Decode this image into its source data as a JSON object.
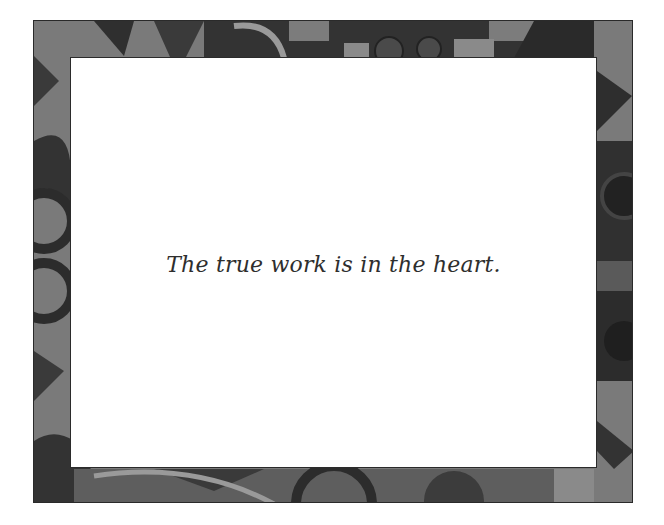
{
  "card": {
    "quote": "The true work is in the heart."
  },
  "border": {
    "style": "celtic-knot-ornamental-frame",
    "colors": {
      "light": "#8c8c8c",
      "mid": "#5a5a5a",
      "dark": "#2e2e2e",
      "outline": "#1e1e1e"
    }
  }
}
